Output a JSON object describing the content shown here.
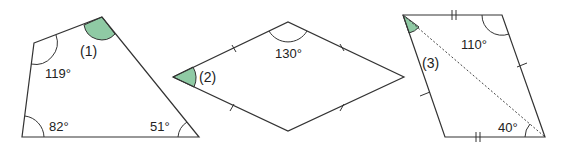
{
  "figures": [
    {
      "id": "1",
      "label": "(1)",
      "shape": "quadrilateral",
      "angles": [
        "119°",
        "82°",
        "51°"
      ],
      "unknown_angle": "top-right vertex (shaded)"
    },
    {
      "id": "2",
      "label": "(2)",
      "shape": "rhombus",
      "angles": [
        "130°"
      ],
      "unknown_angle": "left vertex (shaded)"
    },
    {
      "id": "3",
      "label": "(3)",
      "shape": "parallelogram with diagonal",
      "angles": [
        "110°",
        "40°"
      ],
      "unknown_angle": "top-left vertex between left side and diagonal (shaded)"
    }
  ],
  "colors": {
    "shade": "#8fcaa4",
    "stroke": "#333333"
  }
}
